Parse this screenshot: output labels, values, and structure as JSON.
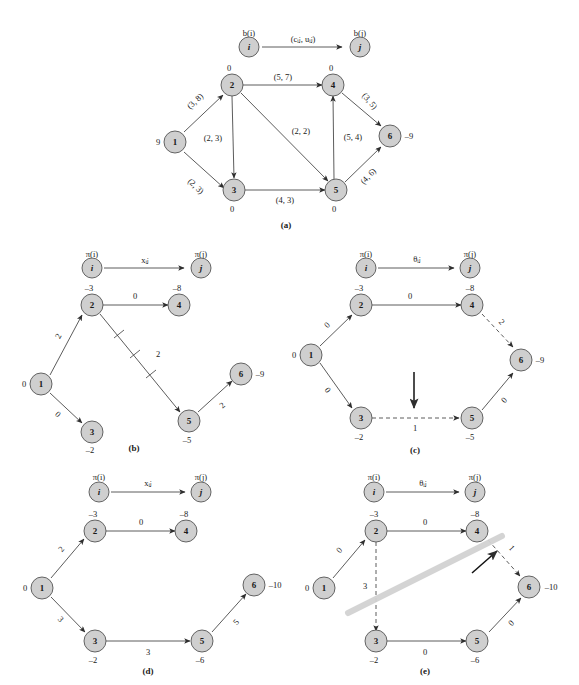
{
  "figure": {
    "background_color": "#ffffff",
    "node_fill_color": "#cfcfcf",
    "node_stroke_color": "#555555",
    "edge_color": "#4a4a4a",
    "highlight_color": "#d2d2d2"
  },
  "panels": [
    {
      "id": "a",
      "caption": "(a)",
      "legend": {
        "source_node": "i",
        "target_node": "j",
        "source_top_label": "b(i)",
        "target_top_label": "b(j)",
        "edge_label": "(cᵢⱼ, uᵢⱼ)"
      },
      "nodes": [
        {
          "id": "1",
          "label": "1",
          "supply": "9",
          "supply_pos": "left"
        },
        {
          "id": "2",
          "label": "2",
          "supply": "0",
          "supply_pos": "top"
        },
        {
          "id": "3",
          "label": "3",
          "supply": "0",
          "supply_pos": "bottom"
        },
        {
          "id": "4",
          "label": "4",
          "supply": "0",
          "supply_pos": "top"
        },
        {
          "id": "5",
          "label": "5",
          "supply": "0",
          "supply_pos": "bottom"
        },
        {
          "id": "6",
          "label": "6",
          "supply": "–9",
          "supply_pos": "right"
        }
      ],
      "edges": [
        {
          "from": "1",
          "to": "2",
          "label": "(3, 8)",
          "style": "solid",
          "rotated": true
        },
        {
          "from": "1",
          "to": "3",
          "label": "(2, 3)",
          "style": "solid",
          "rotated": true
        },
        {
          "from": "2",
          "to": "4",
          "label": "(5, 7)",
          "style": "solid",
          "rotated": false
        },
        {
          "from": "2",
          "to": "3",
          "label": "(2, 3)",
          "style": "solid",
          "rotated": false
        },
        {
          "from": "2",
          "to": "5",
          "label": "(2, 2)",
          "style": "solid",
          "rotated": false
        },
        {
          "from": "3",
          "to": "5",
          "label": "(4, 3)",
          "style": "solid",
          "rotated": false
        },
        {
          "from": "5",
          "to": "4",
          "label": "(5, 4)",
          "style": "solid",
          "rotated": false
        },
        {
          "from": "4",
          "to": "6",
          "label": "(3, 5)",
          "style": "solid",
          "rotated": true
        },
        {
          "from": "5",
          "to": "6",
          "label": "(4, 6)",
          "style": "solid",
          "rotated": true
        }
      ]
    },
    {
      "id": "b",
      "caption": "(b)",
      "legend": {
        "source_node": "i",
        "target_node": "j",
        "source_top_label": "π(i)",
        "target_top_label": "π(j)",
        "edge_label": "xᵢⱼ"
      },
      "nodes": [
        {
          "id": "1",
          "label": "1",
          "potential": "0",
          "potential_pos": "left"
        },
        {
          "id": "2",
          "label": "2",
          "potential": "–3",
          "potential_pos": "top"
        },
        {
          "id": "3",
          "label": "3",
          "potential": "–2",
          "potential_pos": "bottom"
        },
        {
          "id": "4",
          "label": "4",
          "potential": "–8",
          "potential_pos": "top"
        },
        {
          "id": "5",
          "label": "5",
          "potential": "–5",
          "potential_pos": "bottom"
        },
        {
          "id": "6",
          "label": "6",
          "potential": "–9",
          "potential_pos": "right"
        }
      ],
      "edges": [
        {
          "from": "1",
          "to": "2",
          "label": "2",
          "style": "solid",
          "rotated": true
        },
        {
          "from": "1",
          "to": "3",
          "label": "0",
          "style": "solid",
          "rotated": true
        },
        {
          "from": "2",
          "to": "4",
          "label": "0",
          "style": "solid",
          "rotated": false
        },
        {
          "from": "2",
          "to": "5",
          "label": "2",
          "style": "solid-crossed",
          "rotated": false,
          "cross_count": 3
        },
        {
          "from": "5",
          "to": "6",
          "label": "2",
          "style": "solid",
          "rotated": true
        }
      ]
    },
    {
      "id": "c",
      "caption": "(c)",
      "legend": {
        "source_node": "i",
        "target_node": "j",
        "source_top_label": "π(i)",
        "target_top_label": "π(j)",
        "edge_label": "θᵢⱼ"
      },
      "nodes": [
        {
          "id": "1",
          "label": "1",
          "potential": "0",
          "potential_pos": "left"
        },
        {
          "id": "2",
          "label": "2",
          "potential": "–3",
          "potential_pos": "top"
        },
        {
          "id": "3",
          "label": "3",
          "potential": "–2",
          "potential_pos": "bottom"
        },
        {
          "id": "4",
          "label": "4",
          "potential": "–8",
          "potential_pos": "top"
        },
        {
          "id": "5",
          "label": "5",
          "potential": "–5",
          "potential_pos": "bottom"
        },
        {
          "id": "6",
          "label": "6",
          "potential": "–9",
          "potential_pos": "right"
        }
      ],
      "edges": [
        {
          "from": "1",
          "to": "2",
          "label": "0",
          "style": "solid",
          "rotated": true
        },
        {
          "from": "1",
          "to": "3",
          "label": "0",
          "style": "solid",
          "rotated": true
        },
        {
          "from": "2",
          "to": "4",
          "label": "0",
          "style": "solid",
          "rotated": false
        },
        {
          "from": "3",
          "to": "5",
          "label": "1",
          "style": "dashed",
          "rotated": false
        },
        {
          "from": "4",
          "to": "6",
          "label": "2",
          "style": "dashed",
          "rotated": true
        },
        {
          "from": "5",
          "to": "6",
          "label": "0",
          "style": "solid",
          "rotated": true
        }
      ],
      "annotation": {
        "type": "down-arrow",
        "target_edge": "3-5"
      }
    },
    {
      "id": "d",
      "caption": "(d)",
      "legend": {
        "source_node": "i",
        "target_node": "j",
        "source_top_label": "π(i)",
        "target_top_label": "π(j)",
        "edge_label": "xᵢⱼ"
      },
      "nodes": [
        {
          "id": "1",
          "label": "1",
          "potential": "0",
          "potential_pos": "left"
        },
        {
          "id": "2",
          "label": "2",
          "potential": "–3",
          "potential_pos": "top"
        },
        {
          "id": "3",
          "label": "3",
          "potential": "–2",
          "potential_pos": "bottom"
        },
        {
          "id": "4",
          "label": "4",
          "potential": "–8",
          "potential_pos": "top"
        },
        {
          "id": "5",
          "label": "5",
          "potential": "–6",
          "potential_pos": "bottom"
        },
        {
          "id": "6",
          "label": "6",
          "potential": "–10",
          "potential_pos": "right"
        }
      ],
      "edges": [
        {
          "from": "1",
          "to": "2",
          "label": "2",
          "style": "solid",
          "rotated": true
        },
        {
          "from": "1",
          "to": "3",
          "label": "3",
          "style": "solid",
          "rotated": true
        },
        {
          "from": "2",
          "to": "4",
          "label": "0",
          "style": "solid",
          "rotated": false
        },
        {
          "from": "3",
          "to": "5",
          "label": "3",
          "style": "solid",
          "rotated": false
        },
        {
          "from": "5",
          "to": "6",
          "label": "5",
          "style": "solid",
          "rotated": true
        }
      ]
    },
    {
      "id": "e",
      "caption": "(e)",
      "legend": {
        "source_node": "i",
        "target_node": "j",
        "source_top_label": "π(i)",
        "target_top_label": "π(j)",
        "edge_label": "θᵢⱼ"
      },
      "nodes": [
        {
          "id": "1",
          "label": "1",
          "potential": "0",
          "potential_pos": "left"
        },
        {
          "id": "2",
          "label": "2",
          "potential": "–3",
          "potential_pos": "top"
        },
        {
          "id": "3",
          "label": "3",
          "potential": "–2",
          "potential_pos": "bottom"
        },
        {
          "id": "4",
          "label": "4",
          "potential": "–8",
          "potential_pos": "top"
        },
        {
          "id": "5",
          "label": "5",
          "potential": "–6",
          "potential_pos": "bottom"
        },
        {
          "id": "6",
          "label": "6",
          "potential": "–10",
          "potential_pos": "right"
        }
      ],
      "edges": [
        {
          "from": "1",
          "to": "2",
          "label": "0",
          "style": "solid",
          "rotated": true
        },
        {
          "from": "2",
          "to": "4",
          "label": "0",
          "style": "solid",
          "rotated": false
        },
        {
          "from": "2",
          "to": "3",
          "label": "3",
          "style": "dashed",
          "rotated": false
        },
        {
          "from": "3",
          "to": "5",
          "label": "0",
          "style": "solid",
          "rotated": false
        },
        {
          "from": "4",
          "to": "6",
          "label": "1",
          "style": "dashed",
          "rotated": true
        },
        {
          "from": "5",
          "to": "6",
          "label": "0",
          "style": "solid",
          "rotated": true
        }
      ],
      "annotation": {
        "type": "up-arrow-and-highlight-bar",
        "target_edge": "4-6"
      }
    }
  ]
}
